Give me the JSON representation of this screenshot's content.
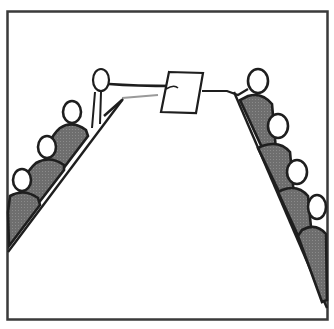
{
  "illustration": {
    "caption": "Meeting table pictogram: a person hands a document across the table to a person on the other side",
    "colors": {
      "background": "#ffffff",
      "frame": "#3a3a3a",
      "outline": "#1e1e1e",
      "body_fill": "#6e6e6e",
      "head_fill": "#ffffff"
    },
    "left_side": {
      "standing_person": "presenter-holding-document",
      "seated_people_count": 3
    },
    "right_side": {
      "seated_people_count": 4
    },
    "center_object": "document-icon"
  }
}
